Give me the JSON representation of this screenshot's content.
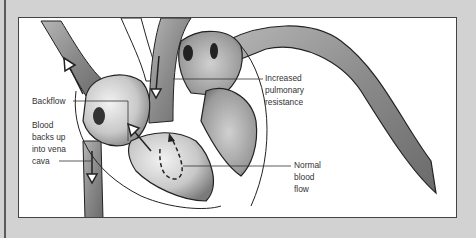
{
  "diagram": {
    "colors": {
      "background": "#d2d2d2",
      "panel": "#ffffff",
      "ink": "#333333",
      "vessel_shade": "#8a8a8a"
    },
    "labels": {
      "backflow": "Backflow",
      "vena_cava": "Blood\nbacks up\ninto vena\ncava",
      "pulmonary": "Increased\npulmonary\nresistance",
      "normal_flow": "Normal\nblood\nflow"
    }
  }
}
